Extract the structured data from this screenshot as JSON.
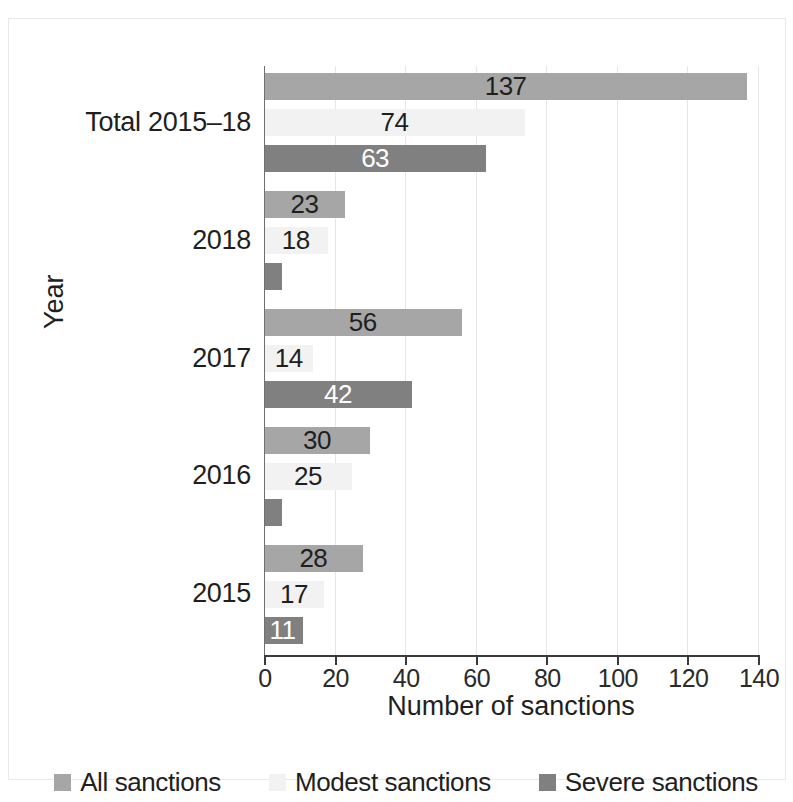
{
  "chart_data": {
    "type": "bar",
    "orientation": "horizontal",
    "title": "",
    "xlabel": "Number of sanctions",
    "ylabel": "Year",
    "xlim": [
      0,
      140
    ],
    "xticks": [
      0,
      20,
      40,
      60,
      80,
      100,
      120,
      140
    ],
    "grid": true,
    "legend_position": "bottom",
    "categories": [
      "Total 2015–18",
      "2018",
      "2017",
      "2016",
      "2015"
    ],
    "series": [
      {
        "name": "All sanctions",
        "color": "#a6a6a6",
        "label_color": "#1f1f1f",
        "values": [
          137,
          23,
          56,
          30,
          28
        ],
        "labels": [
          "137",
          "23",
          "56",
          "30",
          "28"
        ]
      },
      {
        "name": "Modest sanctions",
        "color": "#f2f2f2",
        "label_color": "#1f1f1f",
        "values": [
          74,
          18,
          14,
          25,
          17
        ],
        "labels": [
          "74",
          "18",
          "14",
          "25",
          "17"
        ]
      },
      {
        "name": "Severe sanctions",
        "color": "#808080",
        "label_color": "#ffffff",
        "values": [
          63,
          5,
          42,
          5,
          11
        ],
        "labels": [
          "63",
          "",
          "42",
          "",
          "11"
        ]
      }
    ]
  },
  "axis": {
    "x_title": "Number of sanctions",
    "y_title": "Year",
    "x_tick_labels": [
      "0",
      "20",
      "40",
      "60",
      "80",
      "100",
      "120",
      "140"
    ],
    "y_tick_labels": [
      "Total 2015–18",
      "2018",
      "2017",
      "2016",
      "2015"
    ]
  },
  "legend": {
    "items": [
      {
        "label": "All sanctions",
        "color": "#a6a6a6"
      },
      {
        "label": "Modest sanctions",
        "color": "#f2f2f2"
      },
      {
        "label": "Severe sanctions",
        "color": "#808080"
      }
    ]
  }
}
